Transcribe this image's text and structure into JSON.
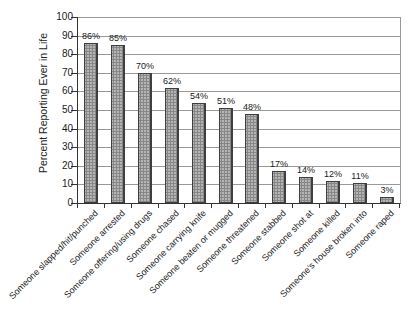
{
  "chart_data": {
    "type": "bar",
    "title": "",
    "xlabel": "",
    "ylabel": "Percent Reporting Ever in Life",
    "ylim": [
      0,
      100
    ],
    "ytick_step": 10,
    "grid": true,
    "legend_position": "none",
    "categories": [
      "Someone slapped/hit/punched",
      "Someone arrested",
      "Someone offering/using drugs",
      "Someone chased",
      "Someone carrying knife",
      "Someone beaten or mugged",
      "Someone threatened",
      "Someone stabbed",
      "Someone shot at",
      "Someone killed",
      "Someone's house broken into",
      "Someone raped"
    ],
    "values": [
      86,
      85,
      70,
      62,
      54,
      51,
      48,
      17,
      14,
      12,
      11,
      3
    ],
    "value_labels": [
      "86%",
      "85%",
      "70%",
      "62%",
      "54%",
      "51%",
      "48%",
      "17%",
      "14%",
      "12%",
      "11%",
      "3%"
    ],
    "colors": {
      "bar_fill": "#b5b5b5",
      "bar_border": "#3f3f3f",
      "gridline": "#999999",
      "axis": "#333333",
      "text": "#1a1a1a",
      "background": "#ffffff"
    }
  }
}
